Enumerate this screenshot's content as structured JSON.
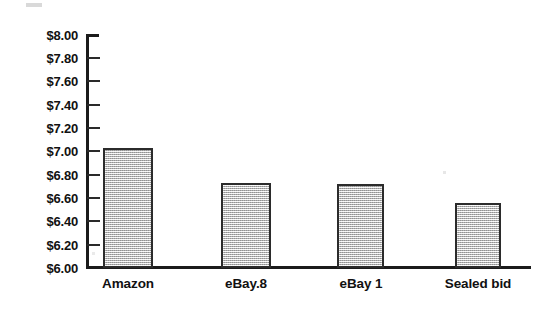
{
  "chart_data": {
    "type": "bar",
    "title": "",
    "subtitle": "",
    "xlabel": "",
    "ylabel": "",
    "categories": [
      "Amazon",
      "eBay.8",
      "eBay 1",
      "Sealed bid"
    ],
    "values": [
      7.03,
      6.73,
      6.72,
      6.56
    ],
    "value_prefix": "$",
    "ylim": [
      6.0,
      8.0
    ],
    "ytick_step": 0.2,
    "ytick_labels": [
      "$8.00",
      "$7.80",
      "$7.60",
      "$7.40",
      "$7.20",
      "$7.00",
      "$6.80",
      "$6.60",
      "$6.40",
      "$6.20",
      "$6.00"
    ],
    "ytick_values": [
      8.0,
      7.8,
      7.6,
      7.4,
      7.2,
      7.0,
      6.8,
      6.6,
      6.4,
      6.2,
      6.0
    ],
    "grid": false,
    "legend": false,
    "legend_position": "none",
    "series": [
      {
        "name": "",
        "values": [
          7.03,
          6.73,
          6.72,
          6.56
        ],
        "bar_fill_color": "#cdcdcd",
        "bar_border_color": "#2b2b2b"
      }
    ],
    "annotations": []
  },
  "style": {
    "background": "#ffffff",
    "axis_color": "#1b1b1b",
    "text_color": "#111111",
    "bar_fill": "#cdcdcd",
    "bar_border": "#2b2b2b"
  }
}
